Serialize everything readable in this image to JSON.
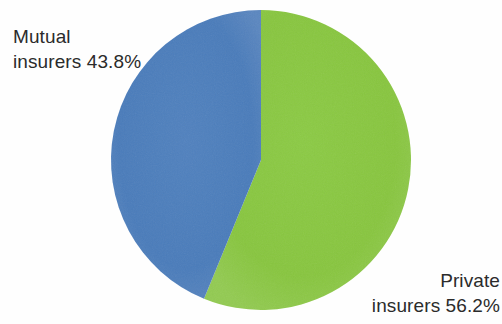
{
  "chart_data": {
    "type": "pie",
    "title": "",
    "subtitle": "",
    "xlabel": "",
    "ylabel": "",
    "legend_position": "none",
    "grid": false,
    "labels": [
      "Private insurers",
      "Mutual insurers"
    ],
    "categories": [
      "Private insurers",
      "Mutual insurers"
    ],
    "values": [
      56.2,
      43.8
    ],
    "value_unit": "%",
    "total": 100.0,
    "start_angle_deg": 0,
    "direction": "clockwise",
    "slices": [
      {
        "name": "Private insurers",
        "value": 56.2,
        "display_value": "56.2%",
        "color": "#88c63f",
        "start_angle_deg": 0.0,
        "end_angle_deg": 202.32,
        "sweep_deg": 202.32,
        "label_line_1": "Private",
        "label_line_2": "insurers 56.2%",
        "label_position": "bottom-right"
      },
      {
        "name": "Mutual insurers",
        "value": 43.8,
        "display_value": "43.8%",
        "color": "#4a7cbb",
        "start_angle_deg": 202.32,
        "end_angle_deg": 360.0,
        "sweep_deg": 157.68,
        "label_line_1": "Mutual",
        "label_line_2": "insurers 43.8%",
        "label_position": "top-left"
      }
    ],
    "geometry": {
      "center_x": 261,
      "center_y": 160,
      "radius": 150
    },
    "colors": {
      "private_insurers": "#88c63f",
      "mutual_insurers": "#4a7cbb",
      "text": "#2b2b2b",
      "background": "#fefefe"
    }
  },
  "labels": {
    "mutual": {
      "line1": "Mutual",
      "line2": "insurers 43.8%"
    },
    "private": {
      "line1": "Private",
      "line2": "insurers 56.2%"
    }
  }
}
